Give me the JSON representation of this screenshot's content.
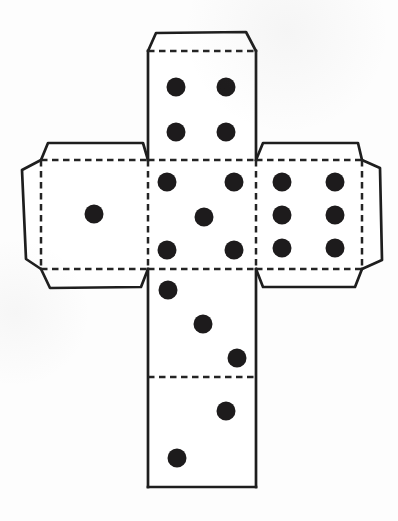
{
  "diagram": {
    "kind": "cube-net-dice-template",
    "canvas": {
      "width": 398,
      "height": 521
    },
    "style": {
      "background": "#fdfdfd",
      "paper_fill": "#ffffff",
      "cut_line_color": "#1e1e1e",
      "fold_line_color": "#242424",
      "pip_color": "#1d1b1c",
      "cut_stroke_width": 2.7,
      "fold_stroke_width": 2.5,
      "fold_dash": "6.5 4.5",
      "pip_radius": 9.5
    },
    "faces": [
      {
        "name": "face-four-top",
        "value": 4,
        "rect": [
          148,
          51,
          108,
          109
        ],
        "pips": [
          [
            176,
            87
          ],
          [
            226,
            87
          ],
          [
            176,
            132
          ],
          [
            226,
            132
          ]
        ]
      },
      {
        "name": "face-one-left",
        "value": 1,
        "rect": [
          41,
          160,
          107,
          109
        ],
        "pips": [
          [
            94,
            214
          ]
        ]
      },
      {
        "name": "face-five-center",
        "value": 5,
        "rect": [
          148,
          160,
          108,
          109
        ],
        "pips": [
          [
            167,
            182
          ],
          [
            234,
            182
          ],
          [
            204,
            217
          ],
          [
            167,
            250
          ],
          [
            234,
            250
          ]
        ]
      },
      {
        "name": "face-six-right",
        "value": 6,
        "rect": [
          256,
          160,
          106,
          109
        ],
        "pips": [
          [
            282,
            182
          ],
          [
            335,
            182
          ],
          [
            282,
            215
          ],
          [
            335,
            215
          ],
          [
            282,
            248
          ],
          [
            335,
            248
          ]
        ]
      },
      {
        "name": "face-three",
        "value": 3,
        "rect": [
          148,
          269,
          108,
          108
        ],
        "pips": [
          [
            168,
            290
          ],
          [
            203,
            324
          ],
          [
            237,
            358
          ]
        ]
      },
      {
        "name": "face-two-bottom",
        "value": 2,
        "rect": [
          148,
          377,
          108,
          110
        ],
        "pips": [
          [
            226,
            411
          ],
          [
            177,
            458
          ]
        ]
      }
    ],
    "glue_tabs": [
      {
        "name": "tab-top",
        "points": [
          [
            148,
            51
          ],
          [
            156,
            33
          ],
          [
            246,
            32
          ],
          [
            256,
            51
          ]
        ]
      },
      {
        "name": "tab-left-top",
        "points": [
          [
            41,
            160
          ],
          [
            48,
            143
          ],
          [
            143,
            143
          ],
          [
            148,
            160
          ]
        ]
      },
      {
        "name": "tab-left-side",
        "points": [
          [
            41,
            160
          ],
          [
            22,
            170
          ],
          [
            26,
            259
          ],
          [
            41,
            269
          ]
        ]
      },
      {
        "name": "tab-left-bottom",
        "points": [
          [
            41,
            269
          ],
          [
            50,
            288
          ],
          [
            141,
            287
          ],
          [
            148,
            269
          ]
        ]
      },
      {
        "name": "tab-right-top",
        "points": [
          [
            256,
            160
          ],
          [
            263,
            143
          ],
          [
            358,
            143
          ],
          [
            362,
            160
          ]
        ]
      },
      {
        "name": "tab-right-side",
        "points": [
          [
            362,
            160
          ],
          [
            380,
            168
          ],
          [
            382,
            260
          ],
          [
            362,
            269
          ]
        ]
      },
      {
        "name": "tab-right-bottom",
        "points": [
          [
            256,
            269
          ],
          [
            263,
            287
          ],
          [
            355,
            287
          ],
          [
            362,
            269
          ]
        ]
      }
    ],
    "cut_lines": [
      {
        "name": "cut-top-face-left-edge",
        "points": [
          [
            148,
            51
          ],
          [
            148,
            160
          ]
        ]
      },
      {
        "name": "cut-top-face-right-edge",
        "points": [
          [
            256,
            51
          ],
          [
            256,
            160
          ]
        ]
      },
      {
        "name": "cut-bottom-column-left-edge",
        "points": [
          [
            148,
            269
          ],
          [
            148,
            487
          ]
        ]
      },
      {
        "name": "cut-bottom-column-right-edge",
        "points": [
          [
            256,
            269
          ],
          [
            256,
            487
          ]
        ]
      },
      {
        "name": "cut-bottom-edge",
        "points": [
          [
            148,
            487
          ],
          [
            256,
            487
          ]
        ]
      }
    ],
    "fold_lines": [
      {
        "name": "fold-top-tab",
        "points": [
          [
            148,
            51
          ],
          [
            256,
            51
          ]
        ]
      },
      {
        "name": "fold-left-face-top",
        "points": [
          [
            41,
            160
          ],
          [
            148,
            160
          ]
        ]
      },
      {
        "name": "fold-four-five",
        "points": [
          [
            148,
            160
          ],
          [
            256,
            160
          ]
        ]
      },
      {
        "name": "fold-right-face-top",
        "points": [
          [
            256,
            160
          ],
          [
            362,
            160
          ]
        ]
      },
      {
        "name": "fold-left-side-tab",
        "points": [
          [
            41,
            160
          ],
          [
            41,
            269
          ]
        ]
      },
      {
        "name": "fold-one-five",
        "points": [
          [
            148,
            160
          ],
          [
            148,
            269
          ]
        ]
      },
      {
        "name": "fold-five-six",
        "points": [
          [
            256,
            160
          ],
          [
            256,
            269
          ]
        ]
      },
      {
        "name": "fold-right-side-tab",
        "points": [
          [
            362,
            160
          ],
          [
            362,
            269
          ]
        ]
      },
      {
        "name": "fold-left-face-bottom",
        "points": [
          [
            41,
            269
          ],
          [
            148,
            269
          ]
        ]
      },
      {
        "name": "fold-five-three",
        "points": [
          [
            148,
            269
          ],
          [
            256,
            269
          ]
        ]
      },
      {
        "name": "fold-right-face-bottom",
        "points": [
          [
            256,
            269
          ],
          [
            362,
            269
          ]
        ]
      },
      {
        "name": "fold-three-two",
        "points": [
          [
            148,
            377
          ],
          [
            256,
            377
          ]
        ]
      }
    ]
  }
}
